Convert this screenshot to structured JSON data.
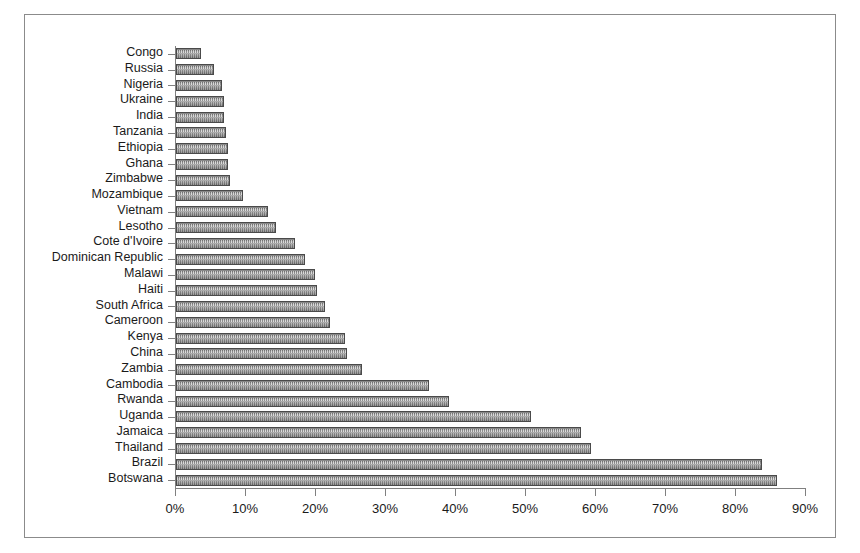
{
  "chart_data": {
    "type": "bar",
    "orientation": "horizontal",
    "title": "",
    "subtitle": "",
    "xlabel": "",
    "ylabel": "",
    "xlim": [
      0,
      90
    ],
    "ylim": [
      0,
      26
    ],
    "grid": false,
    "legend": null,
    "value_suffix": "%",
    "xticks": [
      0,
      10,
      20,
      30,
      40,
      50,
      60,
      70,
      80,
      90
    ],
    "xticklabels": [
      "0%",
      "10%",
      "20%",
      "30%",
      "40%",
      "50%",
      "60%",
      "70%",
      "80%",
      "90%"
    ],
    "categories": [
      "Congo",
      "Russia",
      "Nigeria",
      "Ukraine",
      "India",
      "Tanzania",
      "Ethiopia",
      "Ghana",
      "Zimbabwe",
      "Mozambique",
      "Vietnam",
      "Lesotho",
      "Cote d'Ivoire",
      "Dominican Republic",
      "Malawi",
      "Haiti",
      "South Africa",
      "Cameroon",
      "Kenya",
      "China",
      "Zambia",
      "Cambodia",
      "Rwanda",
      "Uganda",
      "Jamaica",
      "Thailand",
      "Brazil",
      "Botswana"
    ],
    "values": [
      3.6,
      5.4,
      6.6,
      6.8,
      6.8,
      7.1,
      7.4,
      7.4,
      7.7,
      9.6,
      13.2,
      14.3,
      17.0,
      18.4,
      19.8,
      20.2,
      21.3,
      22.0,
      24.2,
      24.4,
      26.6,
      36.1,
      39.0,
      50.7,
      57.8,
      59.3,
      83.7,
      85.9
    ],
    "bar_color": "#9a9a9a",
    "bar_edge_color": "#4a4a4a",
    "background_color": "#ffffff",
    "frame_color": "#8b8b8b"
  }
}
